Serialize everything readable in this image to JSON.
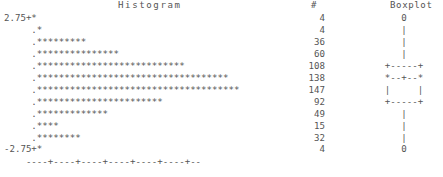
{
  "headers": {
    "histogram": "Histogram",
    "count": "#",
    "boxplot": "Boxplot"
  },
  "axis": {
    "top_label": "2.75+",
    "bottom_label": "-2.75+",
    "tick_line": "    ----+----+----+----+----+----+--"
  },
  "chart_data": {
    "type": "bar",
    "title": "Histogram",
    "xlabel": "",
    "ylabel": "",
    "orientation": "horizontal",
    "grid": false,
    "legend": "none",
    "axis_tick_label_top": "2.75+",
    "axis_tick_label_bottom": "-2.75+",
    "ylim": [
      -2.75,
      2.75
    ],
    "categories": [
      "2.75",
      "2.25",
      "1.75",
      "1.25",
      "0.75",
      "0.25",
      "-0.25",
      "-0.75",
      "-1.25",
      "-1.75",
      "-2.25",
      "-2.75"
    ],
    "values": [
      4,
      4,
      36,
      60,
      108,
      138,
      147,
      92,
      49,
      15,
      32,
      4
    ],
    "star_counts": [
      1,
      1,
      9,
      15,
      27,
      35,
      37,
      23,
      13,
      4,
      8,
      1
    ],
    "count_column_header": "#",
    "total": 688,
    "boxplot": {
      "header": "Boxplot",
      "upper_outlier_marker": "0",
      "lower_outlier_marker": "0",
      "whisker_char": "|",
      "box_top": "+-----+",
      "median_row": "*--+--*",
      "box_sides": "|     |",
      "box_bottom": "+-----+"
    }
  },
  "rows": [
    {
      "label": "2.75+",
      "stars": "*",
      "count": "4",
      "box": "0"
    },
    {
      "label": "",
      "stars": ".*",
      "count": "4",
      "box": "|"
    },
    {
      "label": "",
      "stars": ".*********",
      "count": "36",
      "box": "|"
    },
    {
      "label": "",
      "stars": ".***************",
      "count": "60",
      "box": "|"
    },
    {
      "label": "",
      "stars": ".***************************",
      "count": "108",
      "box": "+-----+"
    },
    {
      "label": "",
      "stars": ".***********************************",
      "count": "138",
      "box": "*--+--*"
    },
    {
      "label": "",
      "stars": ".*************************************",
      "count": "147",
      "box": "|     |"
    },
    {
      "label": "",
      "stars": ".***********************",
      "count": "92",
      "box": "+-----+"
    },
    {
      "label": "",
      "stars": ".*************",
      "count": "49",
      "box": "|"
    },
    {
      "label": "",
      "stars": ".****",
      "count": "15",
      "box": "|"
    },
    {
      "label": "",
      "stars": ".********",
      "count": "32",
      "box": "|"
    },
    {
      "label": "-2.75+",
      "stars": "*",
      "count": "4",
      "box": "0"
    }
  ],
  "blocks": {
    "histogram_text": "2.75+*\n     .*\n     .*********\n     .***************\n     .***************************\n     .***********************************\n     .*************************************\n     .***********************\n     .*************\n     .****\n     .********\n-2.75+*",
    "count_text": "4\n4\n36\n60\n108\n138\n147\n92\n49\n15\n32\n4",
    "boxplot_text": "0\n|\n|\n|\n+-----+\n*--+--*\n|     |\n+-----+\n|\n|\n|\n0",
    "axis_text": "    ----+----+----+----+----+----+--"
  }
}
